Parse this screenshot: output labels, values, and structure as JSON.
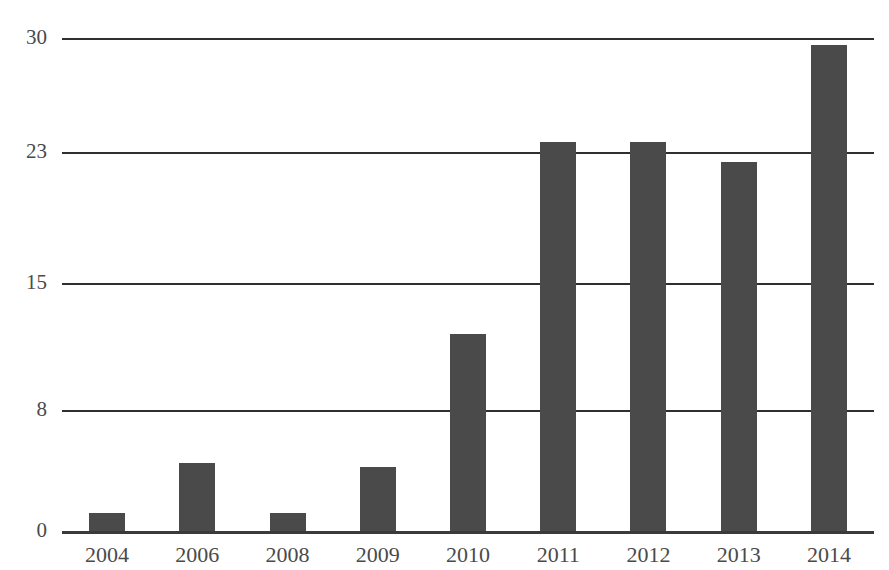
{
  "chart_data": {
    "type": "bar",
    "title": "",
    "title_note": "title clipped off top edge of screenshot (CJK, unreadable)",
    "xlabel": "",
    "ylabel": "",
    "categories": [
      "2004",
      "2006",
      "2008",
      "2009",
      "2010",
      "2011",
      "2012",
      "2013",
      "2014"
    ],
    "values": [
      1.2,
      4.5,
      1.2,
      4.2,
      12.2,
      23.6,
      23.6,
      22.4,
      29.6
    ],
    "series": [
      {
        "name": "",
        "values": [
          1.2,
          4.5,
          1.2,
          4.2,
          12.2,
          23.6,
          23.6,
          22.4,
          29.6
        ]
      }
    ],
    "ylim": [
      0,
      30
    ],
    "yticks": [
      0,
      8,
      15,
      23,
      30
    ],
    "ytick_labels": [
      "0",
      "8",
      "15",
      "23",
      "30"
    ],
    "grid": true,
    "legend": "none",
    "bar_color": "#4a4a4a",
    "background_color": "#ffffff",
    "axis_color": "#2f2f2f"
  },
  "axes": {
    "y_ticks": [
      {
        "label": "30",
        "value": 30
      },
      {
        "label": "23",
        "value": 23
      },
      {
        "label": "15",
        "value": 15
      },
      {
        "label": "8",
        "value": 8
      },
      {
        "label": "0",
        "value": 0
      }
    ],
    "x_ticks": [
      {
        "label": "2004",
        "value": 1.2
      },
      {
        "label": "2006",
        "value": 4.5
      },
      {
        "label": "2008",
        "value": 1.2
      },
      {
        "label": "2009",
        "value": 4.2
      },
      {
        "label": "2010",
        "value": 12.2
      },
      {
        "label": "2011",
        "value": 23.6
      },
      {
        "label": "2012",
        "value": 23.6
      },
      {
        "label": "2013",
        "value": 22.4
      },
      {
        "label": "2014",
        "value": 29.6
      }
    ]
  }
}
